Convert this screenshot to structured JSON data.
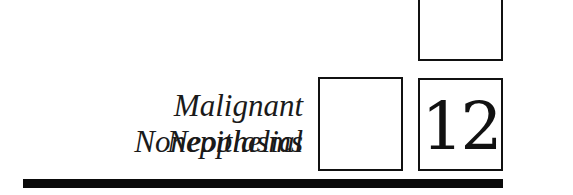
{
  "chapter": {
    "number": "12",
    "title_line1": "Malignant Nonepithelial",
    "title_line2": "Neoplasms"
  }
}
